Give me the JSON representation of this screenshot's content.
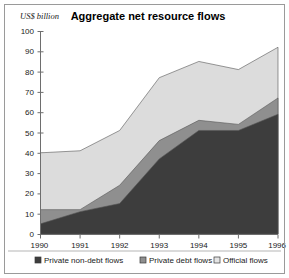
{
  "chart_data": {
    "type": "area",
    "stacked": true,
    "title": "Aggregate net resource flows",
    "ylabel": "US$ billion",
    "xlabel": "",
    "x": [
      1990,
      1991,
      1992,
      1993,
      1994,
      1995,
      1996
    ],
    "categories": [
      "1990",
      "1991",
      "1992",
      "1993",
      "1994",
      "1995",
      "1996"
    ],
    "xtick_labels": [
      "1990",
      "1991",
      "1992",
      "1993",
      "1994",
      "1995",
      "1996"
    ],
    "ytick_labels": [
      "0",
      "10",
      "20",
      "30",
      "40",
      "50",
      "60",
      "70",
      "80",
      "90",
      "100"
    ],
    "ytick_values": [
      0,
      10,
      20,
      30,
      40,
      50,
      60,
      70,
      80,
      90,
      100
    ],
    "ylim": [
      0,
      100
    ],
    "xlim": [
      1990,
      1996
    ],
    "grid": false,
    "legend_position": "bottom",
    "series": [
      {
        "name": "Private non-debt flows",
        "color": "#3d3d3d",
        "values": [
          5,
          11,
          15,
          37,
          51,
          51,
          59
        ]
      },
      {
        "name": "Private debt flows",
        "color": "#8f8f8f",
        "values": [
          7,
          1,
          9,
          9,
          5,
          3,
          8
        ]
      },
      {
        "name": "Official flows",
        "color": "#dcdcdc",
        "values": [
          28,
          29,
          27,
          31,
          29,
          27,
          25
        ]
      }
    ],
    "cumulative_totals": [
      40,
      41,
      51,
      77,
      85,
      81,
      92
    ]
  },
  "legend": {
    "items": [
      {
        "label": "Private non-debt flows",
        "swatch": "#3d3d3d"
      },
      {
        "label": "Private debt flows",
        "swatch": "#8f8f8f"
      },
      {
        "label": "Official flows",
        "swatch": "#e4e4e4"
      }
    ]
  }
}
